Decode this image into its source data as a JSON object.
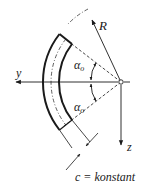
{
  "diagram": {
    "type": "curved-beam-cross-section",
    "labels": {
      "radius": "R",
      "y_axis": "y",
      "z_axis": "z",
      "angle_upper": "α",
      "angle_upper_sub": "o",
      "angle_lower": "α",
      "angle_lower_sub": "o",
      "thickness": "c = konstant"
    },
    "colors": {
      "line": "#1a1a1a",
      "background": "#ffffff"
    }
  }
}
